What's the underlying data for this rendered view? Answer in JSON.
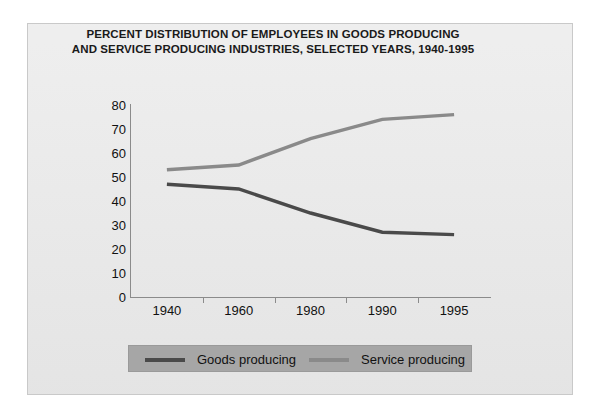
{
  "chart_data": {
    "type": "line",
    "title": "PERCENT DISTRIBUTION OF EMPLOYEES IN GOODS PRODUCING AND SERVICE PRODUCING INDUSTRIES, SELECTED YEARS, 1940-1995",
    "title_lines": [
      "PERCENT DISTRIBUTION OF EMPLOYEES IN GOODS PRODUCING",
      "AND SERVICE PRODUCING INDUSTRIES, SELECTED YEARS, 1940-1995"
    ],
    "categories": [
      "1940",
      "1960",
      "1980",
      "1990",
      "1995"
    ],
    "series": [
      {
        "name": "Goods producing",
        "values": [
          47,
          45,
          35,
          27,
          26
        ],
        "color": "#4a4a4a"
      },
      {
        "name": "Service producing",
        "values": [
          53,
          55,
          66,
          74,
          76
        ],
        "color": "#8a8a8a"
      }
    ],
    "xlabel": "",
    "ylabel": "",
    "ylim": [
      0,
      80
    ],
    "ytick_labels": [
      "80",
      "70",
      "60",
      "50",
      "40",
      "30",
      "20",
      "10",
      "0"
    ],
    "ytick_values": [
      80,
      70,
      60,
      50,
      40,
      30,
      20,
      10,
      0
    ],
    "grid": false,
    "legend_position": "bottom",
    "legend": [
      {
        "label": "Goods producing",
        "swatch_color": "#4a4a4a"
      },
      {
        "label": "Service producing",
        "swatch_color": "#8a8a8a"
      }
    ]
  },
  "colors": {
    "page_background": "#ffffff",
    "panel_background": "#e9e9e9",
    "panel_border": "#c9c9c9",
    "axis": "#8b8b8b",
    "text": "#111111",
    "legend_background": "#a6a6a6",
    "goods_producing": "#4a4a4a",
    "service_producing": "#8a8a8a"
  }
}
